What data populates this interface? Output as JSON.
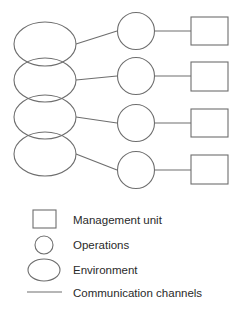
{
  "diagram": {
    "colors": {
      "stroke": "#6e6e6e",
      "text": "#2a2a2a",
      "background": "#ffffff"
    },
    "rows": [
      {
        "environment": "environment-1",
        "operations": "operations-1",
        "management": "management-unit-1"
      },
      {
        "environment": "environment-2",
        "operations": "operations-2",
        "management": "management-unit-2"
      },
      {
        "environment": "environment-3",
        "operations": "operations-3",
        "management": "management-unit-3"
      },
      {
        "environment": "environment-4",
        "operations": "operations-4",
        "management": "management-unit-4"
      }
    ]
  },
  "legend": {
    "items": [
      {
        "shape": "square",
        "label": "Management unit"
      },
      {
        "shape": "circle",
        "label": "Operations"
      },
      {
        "shape": "ellipse",
        "label": "Environment"
      },
      {
        "shape": "line",
        "label": "Communication channels"
      }
    ]
  }
}
